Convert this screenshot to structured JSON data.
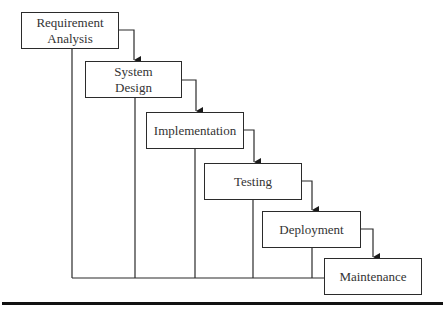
{
  "diagram": {
    "type": "waterfall-model",
    "stages": [
      {
        "label": "Requirement\nAnalysis",
        "x": 21,
        "y": 12,
        "w": 98,
        "h": 37
      },
      {
        "label": "System\nDesign",
        "x": 85,
        "y": 61,
        "w": 97,
        "h": 37
      },
      {
        "label": "Implementation",
        "x": 146,
        "y": 112,
        "w": 98,
        "h": 37
      },
      {
        "label": "Testing",
        "x": 204,
        "y": 163,
        "w": 98,
        "h": 37
      },
      {
        "label": "Deployment",
        "x": 262,
        "y": 211,
        "w": 99,
        "h": 37
      },
      {
        "label": "Maintenance",
        "x": 324,
        "y": 258,
        "w": 98,
        "h": 37
      }
    ],
    "feedback_line_y": 278,
    "line_color": "#2b2b2b"
  }
}
